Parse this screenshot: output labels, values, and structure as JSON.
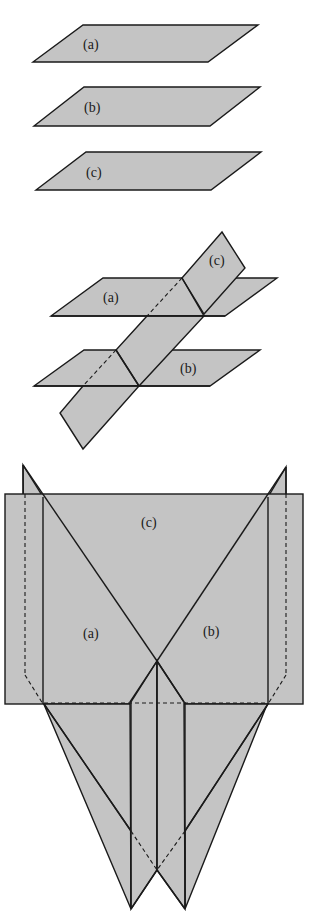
{
  "figure": {
    "panel1": {
      "description": "Three parallel planes",
      "labels": {
        "a": "(a)",
        "b": "(b)",
        "c": "(c)"
      }
    },
    "panel2": {
      "description": "Two parallel planes cut by a transversal plane",
      "labels": {
        "a": "(a)",
        "b": "(b)",
        "c": "(c)"
      }
    },
    "panel3": {
      "description": "Three planes intersecting along a common line",
      "labels": {
        "a": "(a)",
        "b": "(b)",
        "c": "(c)"
      }
    },
    "colors": {
      "plane_fill": "#c4c4c4",
      "stroke": "#1a1a1a",
      "background": "#ffffff"
    }
  }
}
